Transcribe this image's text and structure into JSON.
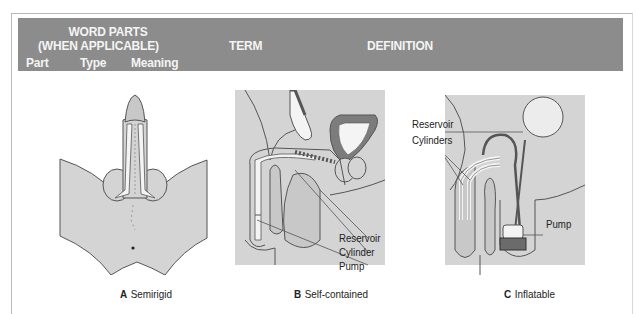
{
  "table_header": {
    "group_title_line1": "WORD PARTS",
    "group_title_line2": "(WHEN APPLICABLE)",
    "term": "TERM",
    "definition": "DEFINITION",
    "columns": [
      "Part",
      "Type",
      "Meaning"
    ]
  },
  "colors": {
    "header_bg": "#8c8c8c",
    "header_text": "#f4f4f4",
    "tissue_fill": "#d4d4d4",
    "outline": "#555555",
    "device_fill": "#f2f2f2",
    "dark_fill": "#6b6b6b"
  },
  "figures": [
    {
      "letter": "A",
      "caption": "Semirigid",
      "labels": []
    },
    {
      "letter": "B",
      "caption": "Self-contained",
      "labels": [
        "Reservoir",
        "Cylinder",
        "Pump"
      ]
    },
    {
      "letter": "C",
      "caption": "Inflatable",
      "labels": [
        "Reservoir",
        "Cylinders",
        "Pump"
      ]
    }
  ]
}
